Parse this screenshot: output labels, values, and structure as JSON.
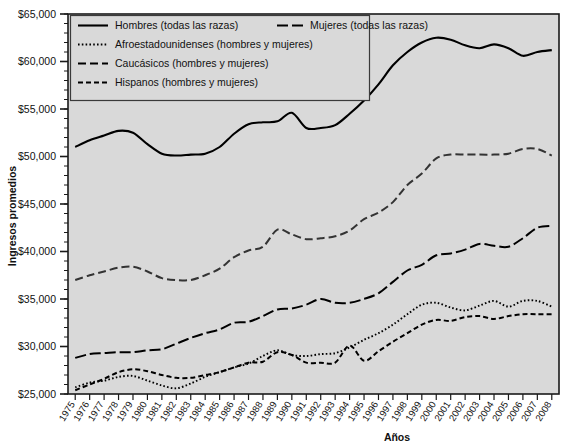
{
  "chart_data": {
    "type": "line",
    "title": "",
    "xlabel": "Años",
    "ylabel": "Ingresos promedios",
    "ylim": [
      25000,
      65000
    ],
    "ytick_values": [
      25000,
      30000,
      35000,
      40000,
      45000,
      50000,
      55000,
      60000,
      65000
    ],
    "ytick_labels": [
      "$25,000",
      "$30,000",
      "$35,000",
      "$40,000",
      "$45,000",
      "$50,000",
      "$55,000",
      "$60,000",
      "$65,000"
    ],
    "minor_tick_step": 1000,
    "grid": false,
    "legend_position": "top-left",
    "categories": [
      1975,
      1976,
      1977,
      1978,
      1979,
      1980,
      1981,
      1982,
      1983,
      1984,
      1985,
      1986,
      1987,
      1988,
      1989,
      1990,
      1991,
      1992,
      1993,
      1994,
      1995,
      1996,
      1997,
      1998,
      1999,
      2000,
      2001,
      2002,
      2003,
      2004,
      2005,
      2006,
      2007,
      2008
    ],
    "xtick_labels": [
      "1975",
      "1976",
      "1977",
      "1978",
      "1979",
      "1980",
      "1981",
      "1982",
      "1983",
      "1984",
      "1985",
      "1986",
      "1987",
      "1988",
      "1989",
      "1990",
      "1991",
      "1992",
      "1993",
      "1994",
      "1995",
      "1996",
      "1997",
      "1998",
      "1999",
      "2000",
      "2001",
      "2002",
      "2003",
      "2004",
      "2005",
      "2006",
      "2007",
      "2008"
    ],
    "series": [
      {
        "name": "Hombres (todas las razas)",
        "style": "solid",
        "color": "#000000",
        "values": [
          51000,
          51700,
          52200,
          52700,
          52500,
          51300,
          50300,
          50100,
          50200,
          50300,
          51000,
          52400,
          53400,
          53600,
          53700,
          54600,
          53000,
          53000,
          53300,
          54500,
          55900,
          57600,
          59600,
          61000,
          62000,
          62500,
          62300,
          61700,
          61400,
          61800,
          61400,
          60600,
          61000,
          61200
        ]
      },
      {
        "name": "Mujeres (todas las razas)",
        "style": "dashdot",
        "color": "#000000",
        "values": [
          28800,
          29200,
          29300,
          29400,
          29400,
          29600,
          29700,
          30300,
          30900,
          31400,
          31800,
          32500,
          32600,
          33200,
          33900,
          34000,
          34400,
          35000,
          34600,
          34600,
          35000,
          35600,
          36800,
          38000,
          38600,
          39600,
          39800,
          40200,
          40800,
          40600,
          40500,
          41400,
          42500,
          42700
        ]
      },
      {
        "name": "Afroestadounidenses (hombres y mujeres)",
        "style": "dotted",
        "color": "#000000",
        "values": [
          25700,
          26200,
          26400,
          26800,
          26900,
          26400,
          25900,
          25600,
          26100,
          26800,
          27300,
          27800,
          28200,
          29000,
          29600,
          29100,
          29000,
          29200,
          29300,
          29900,
          30700,
          31400,
          32300,
          33400,
          34400,
          34600,
          34100,
          33800,
          34300,
          34800,
          34200,
          34800,
          34800,
          34200
        ]
      },
      {
        "name": "Caucásicos (hombres y mujeres)",
        "style": "dashed-long",
        "color": "#333333",
        "values": [
          37000,
          37500,
          37900,
          38300,
          38400,
          37900,
          37200,
          37000,
          37000,
          37500,
          38200,
          39400,
          40100,
          40500,
          42300,
          41800,
          41300,
          41400,
          41600,
          42200,
          43400,
          44100,
          45200,
          47000,
          48200,
          49800,
          50200,
          50200,
          50200,
          50200,
          50300,
          50800,
          50800,
          50100
        ]
      },
      {
        "name": "Hispanos (hombres y mujeres)",
        "style": "dashed-short",
        "color": "#000000",
        "values": [
          25400,
          26000,
          26600,
          27300,
          27600,
          27400,
          27000,
          26700,
          26700,
          27000,
          27300,
          27800,
          28300,
          28400,
          29400,
          29100,
          28300,
          28300,
          28300,
          30100,
          28500,
          29500,
          30500,
          31400,
          32300,
          32800,
          32700,
          33100,
          33200,
          32900,
          33200,
          33400,
          33400,
          33400
        ]
      }
    ]
  },
  "legend": {
    "entries": [
      {
        "label": "Hombres (todas las razas)",
        "style": "solid"
      },
      {
        "label": "Mujeres (todas las razas)",
        "style": "dashdot"
      },
      {
        "label": "Afroestadounidenses (hombres y mujeres)",
        "style": "dotted"
      },
      {
        "label": "Caucásicos (hombres y mujeres)",
        "style": "dashed-long"
      },
      {
        "label": "Hispanos (hombres y mujeres)",
        "style": "dashed-short"
      }
    ]
  },
  "axes": {
    "y_title": "Ingresos promedios",
    "x_title": "Años"
  },
  "colors": {
    "plot_background": "#d9d9d9",
    "frame": "#1a1a1a",
    "text": "#111111"
  }
}
